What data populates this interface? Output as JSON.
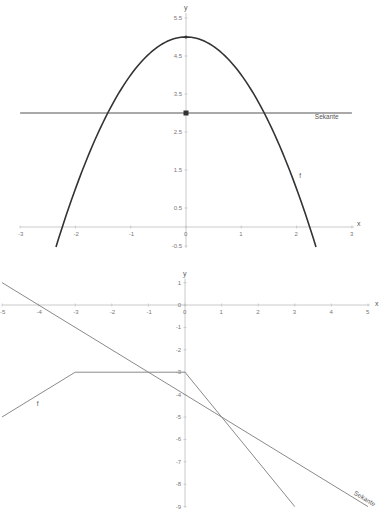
{
  "chart_data": [
    {
      "type": "line",
      "title": "",
      "xlabel": "x",
      "ylabel": "y",
      "xlim": [
        -3,
        3
      ],
      "ylim": [
        -0.5,
        5.5
      ],
      "x_ticks": [
        "-3",
        "-2",
        "-1",
        "0",
        "1",
        "2",
        "3"
      ],
      "y_ticks": [
        "5.5",
        "4.5",
        "3.5",
        "2.5",
        "1.5",
        "0.5",
        "-0.5"
      ],
      "grid": false,
      "series": [
        {
          "name": "f",
          "function": "f(x) = -x^2 + 5",
          "x": [
            -2.35,
            -2,
            -1.5,
            -1,
            -0.5,
            0,
            0.5,
            1,
            1.5,
            2,
            2.35
          ],
          "values": [
            -0.52,
            1,
            2.75,
            4,
            4.75,
            5,
            4.75,
            4,
            2.75,
            1,
            -0.52
          ]
        },
        {
          "name": "Sekante",
          "function": "y = 3",
          "x": [
            -3,
            3
          ],
          "values": [
            3,
            3
          ]
        }
      ],
      "points": [
        {
          "x": 0,
          "y": 5
        },
        {
          "x": 0,
          "y": 3
        }
      ],
      "labels": {
        "curve": "f",
        "line": "Sekante"
      }
    },
    {
      "type": "line",
      "title": "",
      "xlabel": "x",
      "ylabel": "y",
      "xlim": [
        -5,
        5
      ],
      "ylim": [
        -9,
        1
      ],
      "x_ticks": [
        "-5",
        "-4",
        "-3",
        "-2",
        "-1",
        "0",
        "1",
        "2",
        "3",
        "4",
        "5"
      ],
      "y_ticks": [
        "1",
        "0",
        "-1",
        "-2",
        "-3",
        "-4",
        "-5",
        "-6",
        "-7",
        "-8",
        "-9"
      ],
      "grid": false,
      "series": [
        {
          "name": "f",
          "x": [
            -5,
            -3,
            0,
            3
          ],
          "values": [
            -5,
            -3,
            -3,
            -9
          ]
        },
        {
          "name": "Sekante",
          "function": "y = -x - 4",
          "x": [
            -5,
            5
          ],
          "values": [
            1,
            -9
          ]
        }
      ],
      "labels": {
        "curve": "f",
        "line": "Sekante"
      }
    }
  ],
  "top": {
    "axis_x": "x",
    "axis_y": "y",
    "xticks": [
      {
        "v": -3,
        "t": "-3"
      },
      {
        "v": -2,
        "t": "-2"
      },
      {
        "v": -1,
        "t": "-1"
      },
      {
        "v": 0,
        "t": "0"
      },
      {
        "v": 1,
        "t": "1"
      },
      {
        "v": 2,
        "t": "2"
      },
      {
        "v": 3,
        "t": "3"
      }
    ],
    "yticks": [
      {
        "v": 5.5,
        "t": "5.5"
      },
      {
        "v": 4.5,
        "t": "4.5"
      },
      {
        "v": 3.5,
        "t": "3.5"
      },
      {
        "v": 2.5,
        "t": "2.5"
      },
      {
        "v": 1.5,
        "t": "1.5"
      },
      {
        "v": 0.5,
        "t": "0.5"
      },
      {
        "v": -0.5,
        "t": "-0.5"
      }
    ],
    "curve_label": "f",
    "line_label": "Sekante",
    "curve_color": "#333333",
    "line_color": "#555555"
  },
  "bottom": {
    "axis_x": "x",
    "axis_y": "y",
    "xticks": [
      {
        "v": -5,
        "t": "-5"
      },
      {
        "v": -4,
        "t": "-4"
      },
      {
        "v": -3,
        "t": "-3"
      },
      {
        "v": -2,
        "t": "-2"
      },
      {
        "v": -1,
        "t": "-1"
      },
      {
        "v": 0,
        "t": "0"
      },
      {
        "v": 1,
        "t": "1"
      },
      {
        "v": 2,
        "t": "2"
      },
      {
        "v": 3,
        "t": "3"
      },
      {
        "v": 4,
        "t": "4"
      },
      {
        "v": 5,
        "t": "5"
      }
    ],
    "yticks": [
      {
        "v": 1,
        "t": "1"
      },
      {
        "v": 0,
        "t": "0"
      },
      {
        "v": -1,
        "t": "-1"
      },
      {
        "v": -2,
        "t": "-2"
      },
      {
        "v": -3,
        "t": "-3"
      },
      {
        "v": -4,
        "t": "-4"
      },
      {
        "v": -5,
        "t": "-5"
      },
      {
        "v": -6,
        "t": "-6"
      },
      {
        "v": -7,
        "t": "-7"
      },
      {
        "v": -8,
        "t": "-8"
      },
      {
        "v": -9,
        "t": "-9"
      }
    ],
    "curve_label": "f",
    "line_label": "Sekante",
    "line_color": "#8a8a8a"
  }
}
